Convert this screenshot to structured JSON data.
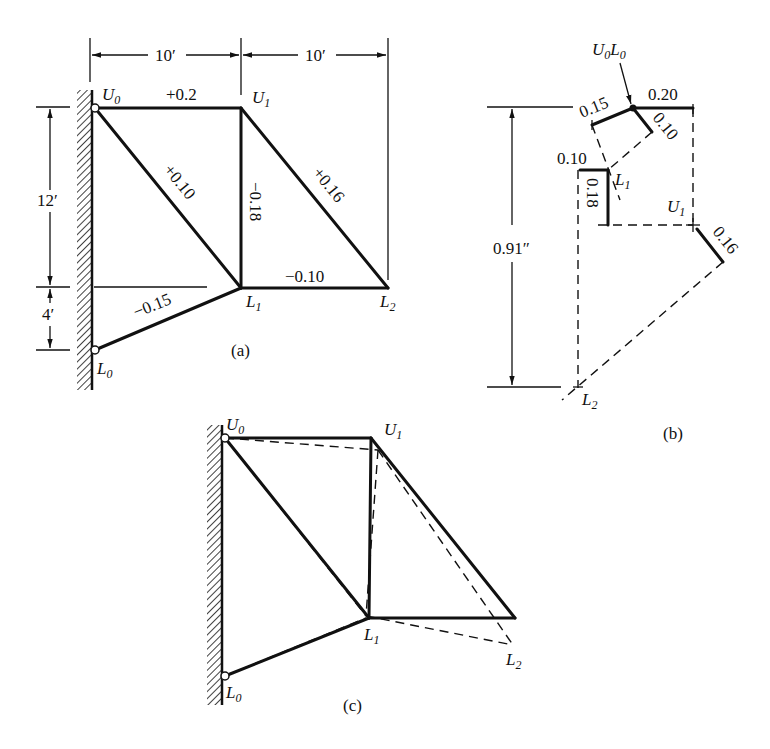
{
  "figure": {
    "panel_a": {
      "caption": "(a)",
      "dims": {
        "top_left": "10′",
        "top_right": "10′",
        "left_upper": "12′",
        "left_lower": "4′"
      },
      "nodes": {
        "U0": "U",
        "U0_sub": "0",
        "U1": "U",
        "U1_sub": "1",
        "L0": "L",
        "L0_sub": "0",
        "L1": "L",
        "L1_sub": "1",
        "L2": "L",
        "L2_sub": "2"
      },
      "members": {
        "U0U1": "+0.2",
        "U0L1": "+0.10",
        "U1L1": "−0.18",
        "U1L2": "+0.16",
        "L1L2": "−0.10",
        "L0L1": "−0.15"
      }
    },
    "panel_b": {
      "caption": "(b)",
      "origin_label": "U",
      "origin_label_sub1": "0",
      "origin_label_mid": "L",
      "origin_label_sub2": "0",
      "segments": {
        "s020": "0.20",
        "s015": "0.15",
        "s010a": "0.10",
        "s010b": "0.10",
        "s018": "0.18",
        "s016": "0.16"
      },
      "dim_total": "0.91″",
      "nodes": {
        "L1": "L",
        "L1_sub": "1",
        "U1": "U",
        "U1_sub": "1",
        "L2": "L",
        "L2_sub": "2"
      }
    },
    "panel_c": {
      "caption": "(c)",
      "nodes": {
        "U0": "U",
        "U0_sub": "0",
        "U1": "U",
        "U1_sub": "1",
        "L0": "L",
        "L0_sub": "0",
        "L1": "L",
        "L1_sub": "1",
        "L2": "L",
        "L2_sub": "2"
      }
    }
  }
}
